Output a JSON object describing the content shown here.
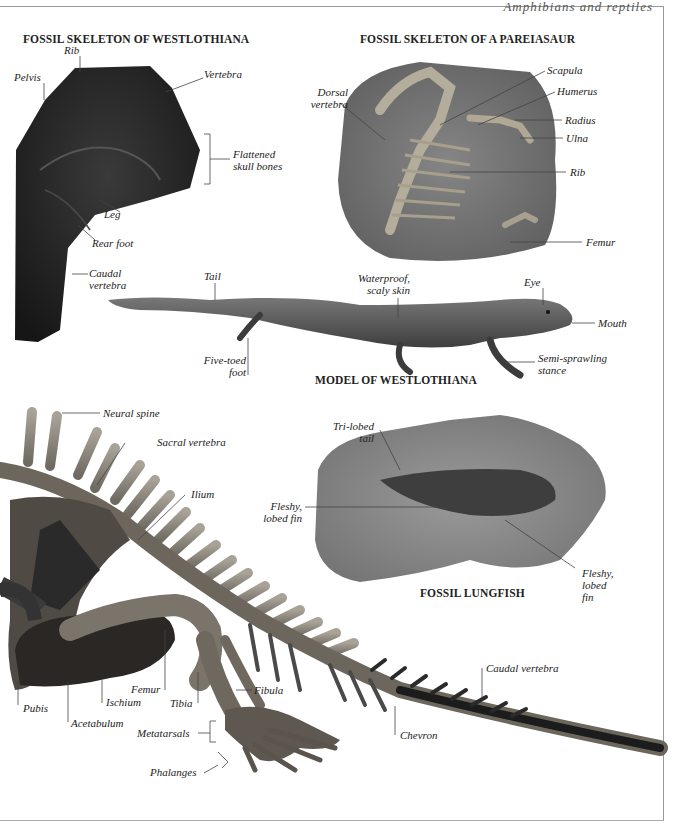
{
  "page": {
    "running_head": "Amphibians and reptiles"
  },
  "sections": {
    "westlothiana_fossil": {
      "title": "FOSSIL SKELETON OF WESTLOTHIANA",
      "labels": {
        "rib": "Rib",
        "pelvis": "Pelvis",
        "vertebra": "Vertebra",
        "flattened_skull_1": "Flattened",
        "flattened_skull_2": "skull bones",
        "leg": "Leg",
        "rear_foot": "Rear foot",
        "caudal_1": "Caudal",
        "caudal_2": "vertebra"
      }
    },
    "pareiasaur_fossil": {
      "title": "FOSSIL SKELETON OF A PAREIASAUR",
      "labels": {
        "dorsal_1": "Dorsal",
        "dorsal_2": "vertebra",
        "scapula": "Scapula",
        "humerus": "Humerus",
        "radius": "Radius",
        "ulna": "Ulna",
        "rib": "Rib",
        "femur": "Femur"
      }
    },
    "westlothiana_model": {
      "title": "MODEL OF WESTLOTHIANA",
      "labels": {
        "tail": "Tail",
        "skin_1": "Waterproof,",
        "skin_2": "scaly skin",
        "eye": "Eye",
        "mouth": "Mouth",
        "foot_1": "Five-toed",
        "foot_2": "foot",
        "stance_1": "Semi-sprawling",
        "stance_2": "stance"
      }
    },
    "lungfish_fossil": {
      "title": "FOSSIL LUNGFISH",
      "labels": {
        "tail_1": "Tri-lobed",
        "tail_2": "tail",
        "fin_left_1": "Fleshy,",
        "fin_left_2": "lobed fin",
        "fin_right_1": "Fleshy,",
        "fin_right_2": "lobed",
        "fin_right_3": "fin"
      }
    },
    "skeleton": {
      "labels": {
        "neural_spine": "Neural spine",
        "sacral_vertebra": "Sacral vertebra",
        "ilium": "Ilium",
        "pubis": "Pubis",
        "acetabulum": "Acetabulum",
        "ischium": "Ischium",
        "femur": "Femur",
        "tibia": "Tibia",
        "fibula": "Fibula",
        "metatarsals": "Metatarsals",
        "phalanges": "Phalanges",
        "chevron": "Chevron",
        "caudal_vertebra": "Caudal vertebra"
      }
    }
  },
  "colors": {
    "westlothiana_rock": "#1f1f1f",
    "pareiasaur_rock": "#6e6e6e",
    "lungfish_rock": "#8a8a8a",
    "bone": "#8f8a80",
    "tail_dark": "#1a1a1a",
    "lizard": "#5a5a5a"
  }
}
